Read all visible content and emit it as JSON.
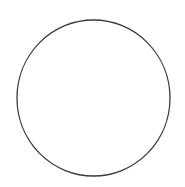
{
  "canvas": {
    "width": 185,
    "height": 187,
    "background_color": "#ffffff"
  },
  "figure": {
    "title": "",
    "caption": "",
    "shape_count": 1
  },
  "shapes": [
    {
      "name": "circle-outline",
      "type": "ellipse",
      "center_x": 93.5,
      "center_y": 98,
      "radius_x": 76.5,
      "radius_y": 78,
      "stroke_color": "#3a3a3a",
      "stroke_width": 1.3,
      "fill_color": "#ffffff",
      "label": ""
    }
  ],
  "chart_data": {
    "type": "scatter",
    "title": "",
    "xlabel": "",
    "ylabel": "",
    "xlim": [
      0,
      185
    ],
    "ylim": [
      0,
      187
    ],
    "grid": false,
    "legend": "none",
    "annotations": [],
    "series": [
      {
        "name": "circle-outline",
        "geometry": "ellipse",
        "center": [
          93.5,
          98
        ],
        "radii": [
          76.5,
          78
        ],
        "bounds": {
          "left": 17,
          "right": 170,
          "top": 20,
          "bottom": 176
        },
        "stroke": "#3a3a3a",
        "fill": "#ffffff",
        "values": []
      }
    ]
  }
}
